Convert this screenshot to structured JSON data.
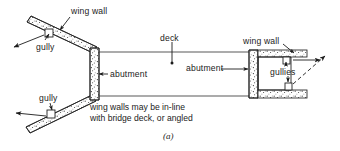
{
  "figure": {
    "id_label": "(a)",
    "labels": {
      "wing_wall_top": "wing wall",
      "gully_upper_left": "gully",
      "gully_lower_left": "gully",
      "deck": "deck",
      "abutment_left": "abutment",
      "abutment_right": "abutment",
      "wing_wall_right": "wing wall",
      "gullies_right": "gullies"
    },
    "note": {
      "line1": "wing walls may be in-line",
      "line2": "with bridge deck, or angled"
    },
    "colors": {
      "ink": "#1b1b1b",
      "line": "#222222",
      "background": "#ffffff",
      "stipple": "#3a3a3a"
    }
  }
}
